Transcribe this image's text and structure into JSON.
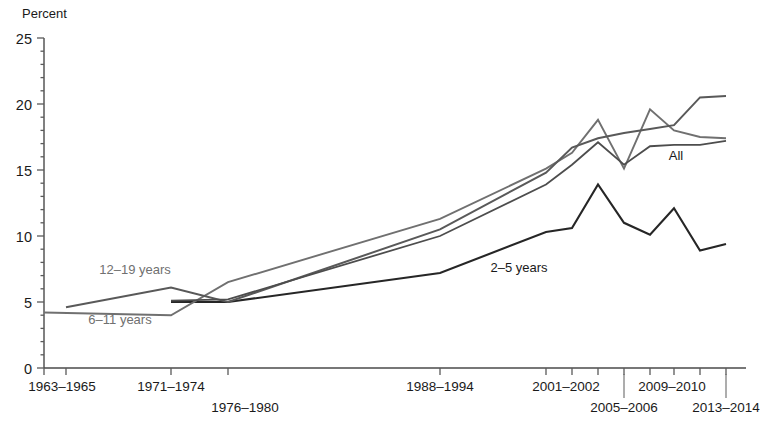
{
  "chart_data": {
    "type": "line",
    "title": "",
    "xlabel": "",
    "ylabel": "Percent",
    "ylim": [
      0,
      25
    ],
    "yticks": [
      0,
      5,
      10,
      15,
      20,
      25
    ],
    "ytick_labels": [
      "0",
      "5",
      "10",
      "15",
      "20",
      "25"
    ],
    "grid": false,
    "legend_position": "inline-annotations",
    "x": [
      "1963-1965",
      "1966-1970",
      "1971-1974",
      "1976-1980",
      "1988-1994",
      "1999-2000",
      "2001-2002",
      "2003-2004",
      "2005-2006",
      "2007-2008",
      "2009-2010",
      "2011-2012",
      "2013-2014"
    ],
    "xtick_labels_row1": [
      "1963–1965",
      "1971–1974",
      "1988–1994",
      "2001–2002",
      "2009–2010"
    ],
    "xtick_labels_row2": [
      "1976–1980",
      "2005–2006",
      "2013–2014"
    ],
    "series": [
      {
        "name": "2-5 years",
        "label": "2–5 years",
        "color": "#262626",
        "width": 2.1,
        "x": [
          "1971-1974",
          "1976-1980",
          "1988-1994",
          "1999-2000",
          "2001-2002",
          "2003-2004",
          "2005-2006",
          "2007-2008",
          "2009-2010",
          "2011-2012",
          "2013-2014"
        ],
        "values": [
          5.0,
          5.0,
          7.2,
          10.3,
          10.6,
          13.9,
          11.0,
          10.1,
          12.1,
          8.9,
          9.4
        ]
      },
      {
        "name": "6-11 years",
        "label": "6–11 years",
        "color": "#707070",
        "width": 1.9,
        "x": [
          "1963-1965",
          "1971-1974",
          "1976-1980",
          "1988-1994",
          "1999-2000",
          "2001-2002",
          "2003-2004",
          "2005-2006",
          "2007-2008",
          "2009-2010",
          "2011-2012",
          "2013-2014"
        ],
        "values": [
          4.2,
          4.0,
          6.5,
          11.3,
          15.1,
          16.3,
          18.8,
          15.1,
          19.6,
          18.0,
          17.5,
          17.4
        ]
      },
      {
        "name": "12-19 years",
        "label": "12–19 years",
        "color": "#595959",
        "width": 2.0,
        "x": [
          "1966-1970",
          "1971-1974",
          "1976-1980",
          "1988-1994",
          "1999-2000",
          "2001-2002",
          "2003-2004",
          "2005-2006",
          "2007-2008",
          "2009-2010",
          "2011-2012",
          "2013-2014"
        ],
        "values": [
          4.6,
          6.1,
          5.0,
          10.5,
          14.8,
          16.7,
          17.4,
          17.8,
          18.1,
          18.4,
          20.5,
          20.6
        ]
      },
      {
        "name": "All",
        "label": "All",
        "color": "#4d4d4d",
        "width": 1.8,
        "x": [
          "1971-1974",
          "1976-1980",
          "1988-1994",
          "1999-2000",
          "2001-2002",
          "2003-2004",
          "2005-2006",
          "2007-2008",
          "2009-2010",
          "2011-2012",
          "2013-2014"
        ],
        "values": [
          5.1,
          5.2,
          10.0,
          13.9,
          15.4,
          17.1,
          15.4,
          16.8,
          16.9,
          16.9,
          17.2
        ]
      }
    ],
    "annotations": [
      {
        "text": "12–19 years",
        "x": 135,
        "y": 274,
        "color": "#707070",
        "anchor": "middle"
      },
      {
        "text": "6–11 years",
        "x": 120,
        "y": 324,
        "color": "#707070",
        "anchor": "middle"
      },
      {
        "text": "2–5 years",
        "x": 519,
        "y": 272,
        "color": "#1a1a1a",
        "anchor": "middle"
      },
      {
        "text": "All",
        "x": 676,
        "y": 160,
        "color": "#1a1a1a",
        "anchor": "middle"
      }
    ]
  },
  "axis": {
    "y_title": "Percent"
  }
}
